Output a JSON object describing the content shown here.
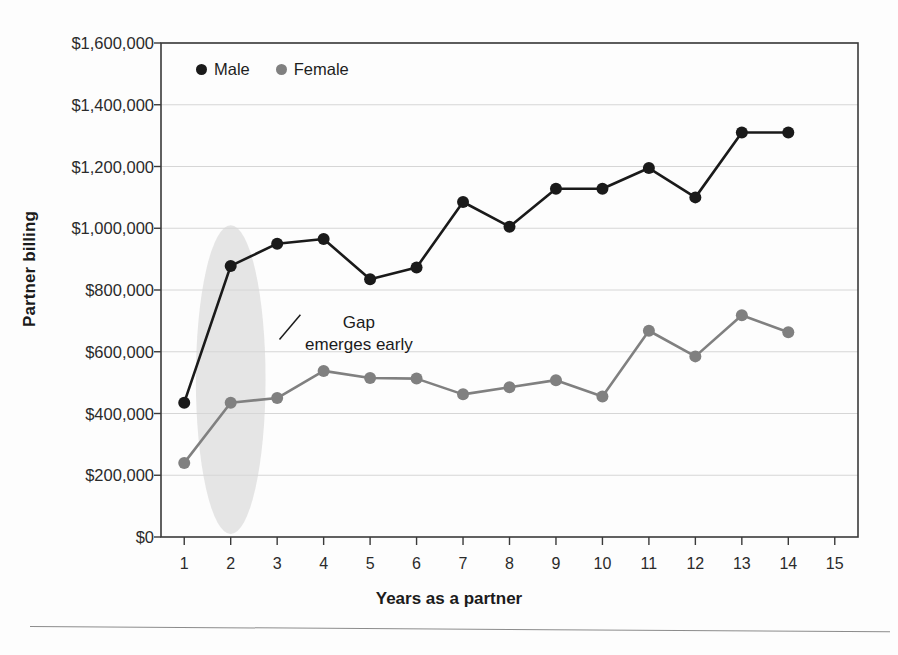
{
  "chart_data": {
    "type": "line",
    "title": "",
    "xlabel": "Years as a partner",
    "ylabel": "Partner billing",
    "x": [
      1,
      2,
      3,
      4,
      5,
      6,
      7,
      8,
      9,
      10,
      11,
      12,
      13,
      14
    ],
    "xlim": [
      0.5,
      15.5
    ],
    "ylim": [
      0,
      1600000
    ],
    "xticks": [
      1,
      2,
      3,
      4,
      5,
      6,
      7,
      8,
      9,
      10,
      11,
      12,
      13,
      14,
      15
    ],
    "xtick_labels": [
      "1",
      "2",
      "3",
      "4",
      "5",
      "6",
      "7",
      "8",
      "9",
      "10",
      "11",
      "12",
      "13",
      "14",
      "15"
    ],
    "yticks": [
      0,
      200000,
      400000,
      600000,
      800000,
      1000000,
      1200000,
      1400000,
      1600000
    ],
    "ytick_labels": [
      "$0",
      "$200,000",
      "$400,000",
      "$600,000",
      "$800,000",
      "$1,000,000",
      "$1,200,000",
      "$1,400,000",
      "$1,600,000"
    ],
    "grid": true,
    "grid_axis": "y",
    "legend_position": "top-left inside",
    "series": [
      {
        "name": "Male",
        "color": "#1a1a1a",
        "marker": "circle",
        "values": [
          435000,
          878000,
          950000,
          965000,
          835000,
          873000,
          1085000,
          1005000,
          1128000,
          1128000,
          1195000,
          1100000,
          1310000,
          1310000
        ]
      },
      {
        "name": "Female",
        "color": "#808080",
        "marker": "circle",
        "values": [
          240000,
          435000,
          450000,
          538000,
          515000,
          513000,
          462000,
          485000,
          508000,
          455000,
          668000,
          585000,
          718000,
          663000
        ]
      }
    ],
    "annotations": [
      {
        "text": "Gap\nemerges early",
        "x_data": 3.6,
        "y_data": 690000,
        "leader_line": {
          "from_x_data": 3.05,
          "from_y_data": 640000,
          "to_x_data": 3.5,
          "to_y_data": 720000
        }
      }
    ],
    "highlight_region": {
      "shape": "ellipse",
      "label": "early-years-highlight",
      "center_x_data": 2.0,
      "center_y_data": 510000,
      "width_x_data": 1.5,
      "height_y_data": 1000000,
      "color": "#e0e0e0"
    }
  },
  "legend": {
    "items": [
      {
        "label": "Male",
        "color": "#1a1a1a"
      },
      {
        "label": "Female",
        "color": "#808080"
      }
    ]
  },
  "axes": {
    "y_title": "Partner billing",
    "x_title": "Years as a partner"
  },
  "annotation_text": "Gap\nemerges early",
  "colors": {
    "male": "#1a1a1a",
    "female": "#808080",
    "highlight": "#e0e0e0",
    "axis": "#3a3a3a",
    "grid": "#d6d6d6",
    "background": "#fdfdfd"
  }
}
